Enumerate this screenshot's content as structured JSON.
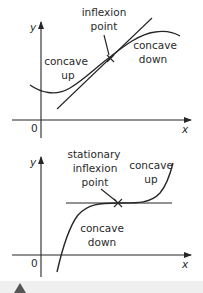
{
  "diagrams": [
    {
      "id": "inflexion",
      "axes": {
        "x_label": "x",
        "y_label": "y",
        "origin_label": "0"
      },
      "annotation": {
        "line1": "inflexion",
        "line2": "point"
      },
      "left_region": {
        "line1": "concave",
        "line2": "up"
      },
      "right_region": {
        "line1": "concave",
        "line2": "down"
      }
    },
    {
      "id": "stationary-inflexion",
      "axes": {
        "x_label": "x",
        "y_label": "y",
        "origin_label": "0"
      },
      "annotation": {
        "line1": "stationary",
        "line2": "inflexion",
        "line3": "point"
      },
      "left_region": {
        "line1": "concave",
        "line2": "down"
      },
      "right_region": {
        "line1": "concave",
        "line2": "up"
      }
    }
  ],
  "colors": {
    "ink": "#262626",
    "band": "#efefef",
    "marker": "#555555"
  }
}
